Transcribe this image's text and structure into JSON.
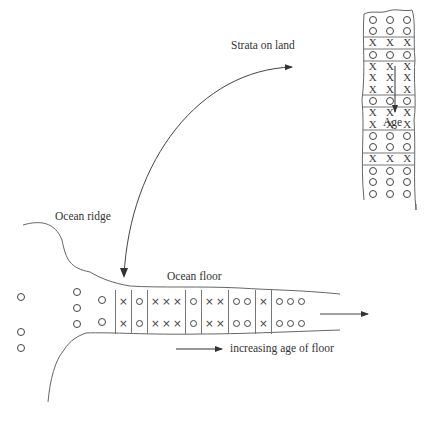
{
  "labels": {
    "strata_on_land": "Strata on land",
    "age": "Age",
    "ocean_ridge": "Ocean ridge",
    "ocean_floor": "Ocean floor",
    "increasing_age": "increasing age of floor"
  },
  "strata_rows": [
    "O",
    "O",
    "X",
    "O",
    "X",
    "X",
    "X",
    "O",
    "X",
    "X",
    "O",
    "O",
    "X",
    "O",
    "O",
    "O"
  ],
  "strata_group_boundaries_after_row": [
    1,
    2,
    3,
    6,
    7,
    9,
    11,
    12
  ],
  "ocean_floor_groups": [
    {
      "symbol": "X",
      "count": 1
    },
    {
      "symbol": "O",
      "count": 1
    },
    {
      "symbol": "X",
      "count": 3
    },
    {
      "symbol": "O",
      "count": 1
    },
    {
      "symbol": "X",
      "count": 2
    },
    {
      "symbol": "O",
      "count": 2
    },
    {
      "symbol": "X",
      "count": 1
    },
    {
      "symbol": "O",
      "count": 3
    }
  ],
  "ridge_dots": [
    {
      "x": 17,
      "y": 293
    },
    {
      "x": 17,
      "y": 328
    },
    {
      "x": 17,
      "y": 344
    },
    {
      "x": 73,
      "y": 288
    },
    {
      "x": 73,
      "y": 304
    },
    {
      "x": 73,
      "y": 320
    },
    {
      "x": 98,
      "y": 296
    },
    {
      "x": 98,
      "y": 318
    }
  ],
  "colors": {
    "line": "#555555",
    "text": "#333333"
  }
}
